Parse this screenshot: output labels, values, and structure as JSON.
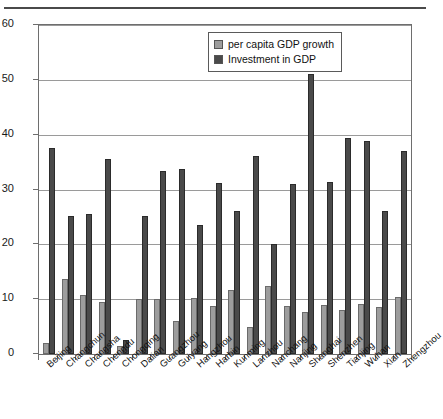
{
  "chart_data": {
    "type": "bar",
    "title": "",
    "subtitle": "",
    "xlabel": "",
    "ylabel": "",
    "ylim": [
      0,
      60
    ],
    "yticks": [
      0,
      10,
      20,
      30,
      40,
      50,
      60
    ],
    "grid": true,
    "legend_position": "top-right",
    "categories": [
      "Beijing",
      "Changchun",
      "Changsha",
      "Chengdu",
      "Chongqing",
      "Dalian",
      "Guangzhou",
      "Guiyang",
      "Hangzhou",
      "Harbin",
      "Kunming",
      "Lanzhou",
      "Nanchang",
      "Nanjing",
      "Shanghai",
      "Shenzhen",
      "Tianjing",
      "Wuhan",
      "Xian",
      "Zhengzhou"
    ],
    "series": [
      {
        "name": "per capita GDP growth",
        "color": "#9d9d9d",
        "values": [
          2.0,
          13.7,
          10.8,
          9.5,
          1.4,
          10.0,
          10.0,
          6.0,
          10.2,
          8.7,
          11.7,
          5.0,
          12.4,
          8.8,
          7.6,
          9.0,
          8.1,
          9.2,
          8.6,
          10.4
        ]
      },
      {
        "name": "Investment in GDP",
        "color": "#4a4a4a",
        "values": [
          37.5,
          25.1,
          25.6,
          35.6,
          2.5,
          25.1,
          33.4,
          33.8,
          23.5,
          31.1,
          26.0,
          36.2,
          20.0,
          31.0,
          51.0,
          31.4,
          39.4,
          38.8,
          26.1,
          37.0
        ]
      }
    ]
  },
  "legend": {
    "items": [
      {
        "label": "per capita GDP growth",
        "color": "#9d9d9d"
      },
      {
        "label": "Investment in GDP",
        "color": "#4a4a4a"
      }
    ]
  }
}
